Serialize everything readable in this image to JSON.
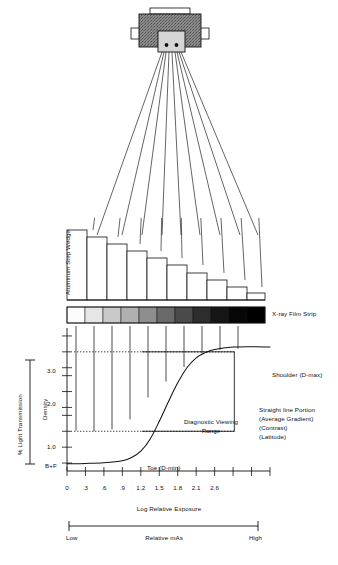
{
  "figure": {
    "source_apparatus": "x-ray-tube-head"
  },
  "apparatus": {
    "tube_head_name": "x-ray-tube-housing",
    "collimator_name": "collimator",
    "beam_rays": 9
  },
  "step_wedge": {
    "label": "Aluminum Step Wedge",
    "steps": 11,
    "step_heights": [
      74,
      67,
      60,
      53,
      46,
      39,
      31,
      24,
      17,
      10,
      5
    ]
  },
  "film_strip": {
    "label": "X-ray Film Strip",
    "steps": [
      {
        "index": 1,
        "color": "#fcfcfc"
      },
      {
        "index": 2,
        "color": "#e6e6e6"
      },
      {
        "index": 3,
        "color": "#c9c9c9"
      },
      {
        "index": 4,
        "color": "#b0b0b0"
      },
      {
        "index": 5,
        "color": "#8e8e8e"
      },
      {
        "index": 6,
        "color": "#6a6a6a"
      },
      {
        "index": 7,
        "color": "#4a4a4a"
      },
      {
        "index": 8,
        "color": "#2d2d2d"
      },
      {
        "index": 9,
        "color": "#161616"
      },
      {
        "index": 10,
        "color": "#070707"
      },
      {
        "index": 11,
        "color": "#000000"
      }
    ]
  },
  "light_transmission": {
    "label": "% Light Transmission"
  },
  "chart_data": {
    "type": "line",
    "xlabel": "Log Relative Exposure",
    "ylabel": "Density",
    "xlim": [
      0,
      3.3
    ],
    "ylim": [
      0,
      3.6
    ],
    "grid": false,
    "legend": "none",
    "x_ticks": [
      "0",
      ".3",
      ".6",
      ".9",
      "1.2",
      "1.5",
      "1.8",
      "2.1",
      "2.6"
    ],
    "x_tick_values": [
      0,
      0.3,
      0.6,
      0.9,
      1.2,
      1.5,
      1.8,
      2.1,
      2.4
    ],
    "x_minor_ticks": [
      2.7,
      3.0,
      3.3
    ],
    "y_ticks": [
      "3.0",
      "2.0",
      "1.0",
      "B+F"
    ],
    "y_tick_values": [
      3.0,
      2.0,
      1.0,
      0.2
    ],
    "y_minor_ticks": [
      3.4,
      2.6,
      2.4,
      1.6,
      1.4,
      0.6
    ],
    "series": [
      {
        "name": "Density vs Log Relative Exposure",
        "x": [
          0.0,
          0.3,
          0.6,
          0.9,
          1.05,
          1.2,
          1.35,
          1.5,
          1.65,
          1.8,
          1.95,
          2.1,
          2.25,
          2.4,
          2.7,
          3.0,
          3.3
        ],
        "y": [
          0.18,
          0.19,
          0.21,
          0.26,
          0.34,
          0.5,
          0.8,
          1.25,
          1.75,
          2.22,
          2.6,
          2.85,
          2.98,
          3.06,
          3.12,
          3.13,
          3.12
        ]
      }
    ],
    "reference_lines": [
      {
        "name": "dmax-reference",
        "axis": "y",
        "value": 3.0,
        "style": "dotted"
      },
      {
        "name": "dmin-reference",
        "axis": "y",
        "value": 1.0,
        "style": "dotted"
      }
    ],
    "annotations": [
      {
        "name": "shoulder",
        "text": "Shoulder (D-max)",
        "position": "right"
      },
      {
        "name": "straight-line-portion",
        "text": "Straight line Portion",
        "position": "right"
      },
      {
        "name": "average-gradient",
        "text": "(Average Gradient)",
        "position": "right"
      },
      {
        "name": "contrast",
        "text": "(Contrast)",
        "position": "right"
      },
      {
        "name": "latitude",
        "text": "(Latitude)",
        "position": "right"
      },
      {
        "name": "diagnostic-viewing-range-line1",
        "text": "Diagnostic Viewing",
        "position": "center"
      },
      {
        "name": "diagnostic-viewing-range-line2",
        "text": "Range",
        "position": "center"
      },
      {
        "name": "toe",
        "text": "Toe (D-min)",
        "position": "bottom-center"
      }
    ],
    "drop_line_bottoms": [
      1.02,
      1.0,
      1.05,
      1.3,
      1.85,
      2.25,
      2.62,
      2.95,
      3.05,
      3.08
    ]
  },
  "exposure_scale": {
    "axis_label": "Log Relative Exposure",
    "bar_label": "Relative mAs",
    "low_label": "Low",
    "high_label": "High"
  },
  "colors": {
    "ink": "#111111",
    "tube_housing": "#7d7d7d",
    "collimator": "#d3d3d3",
    "paper": "#ffffff"
  }
}
